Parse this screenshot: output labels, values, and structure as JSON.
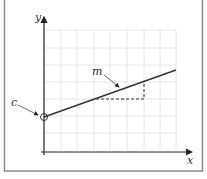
{
  "diagram": {
    "labels": {
      "y_axis": "y",
      "x_axis": "x",
      "gradient": "m",
      "intercept": "c"
    },
    "colors": {
      "frame": "#8a8a8a",
      "grid": "#e0e0e0",
      "axis": "#222222",
      "line": "#333333"
    }
  }
}
